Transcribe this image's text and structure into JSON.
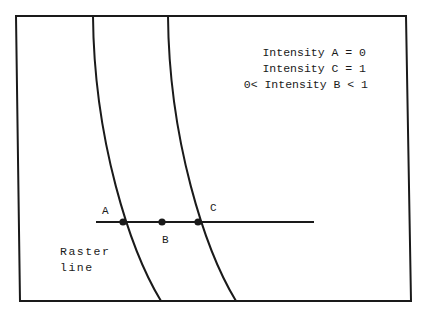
{
  "diagram": {
    "legend": {
      "line1": "Intensity A = 0",
      "line2": "Intensity C = 1",
      "line3": "0< Intensity B < 1"
    },
    "points": {
      "a": "A",
      "b": "B",
      "c": "C"
    },
    "raster_label": {
      "line1": "Raster",
      "line2": "line"
    },
    "colors": {
      "stroke": "#1a1a1a",
      "background": "#ffffff"
    }
  }
}
